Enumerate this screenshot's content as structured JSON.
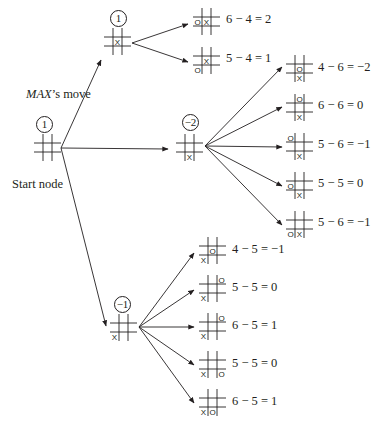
{
  "labels": {
    "max_move_italic": "MAX",
    "max_move_rest": "’s move",
    "start_node": "Start node"
  },
  "nodes": {
    "root": {
      "value": "1",
      "board": [
        "",
        "",
        "",
        "",
        "",
        "",
        "",
        "",
        ""
      ]
    },
    "top": {
      "value": "1",
      "board": [
        "",
        "",
        "",
        "",
        "X",
        "",
        "",
        "",
        ""
      ]
    },
    "middle": {
      "value": "−2",
      "board": [
        "",
        "",
        "",
        "",
        "",
        "",
        "",
        "X",
        ""
      ]
    },
    "bottom": {
      "value": "−1",
      "board": [
        "",
        "",
        "",
        "",
        "",
        "",
        "X",
        "",
        ""
      ]
    }
  },
  "leaves": {
    "top": [
      {
        "board": [
          "",
          "",
          "",
          "O",
          "X",
          "",
          "",
          "",
          ""
        ],
        "eval": "6 − 4 = 2"
      },
      {
        "board": [
          "",
          "",
          "",
          "",
          "X",
          "",
          "O",
          "",
          ""
        ],
        "eval": "5 − 4 = 1"
      }
    ],
    "middle": [
      {
        "board": [
          "",
          "",
          "",
          "",
          "O",
          "",
          "",
          "X",
          ""
        ],
        "eval": "4 − 6 = −2"
      },
      {
        "board": [
          "",
          "O",
          "",
          "",
          "",
          "",
          "",
          "X",
          ""
        ],
        "eval": "6 − 6 = 0"
      },
      {
        "board": [
          "O",
          "",
          "",
          "",
          "",
          "",
          "",
          "X",
          ""
        ],
        "eval": "5 − 6 = −1"
      },
      {
        "board": [
          "",
          "",
          "",
          "O",
          "",
          "",
          "",
          "X",
          ""
        ],
        "eval": "5 − 5 = 0"
      },
      {
        "board": [
          "",
          "",
          "",
          "",
          "",
          "",
          "O",
          "X",
          ""
        ],
        "eval": "5 − 6 = −1"
      }
    ],
    "bottom": [
      {
        "board": [
          "",
          "",
          "",
          "",
          "O",
          "",
          "X",
          "",
          ""
        ],
        "eval": "4 − 5 = −1"
      },
      {
        "board": [
          "",
          "",
          "O",
          "",
          "",
          "",
          "X",
          "",
          ""
        ],
        "eval": "5 − 5 = 0"
      },
      {
        "board": [
          "",
          "",
          "O",
          "",
          "",
          "",
          "X",
          "",
          ""
        ],
        "eval": "6 − 5 = 1"
      },
      {
        "board": [
          "",
          "",
          "",
          "",
          "",
          "",
          "X",
          "",
          "O"
        ],
        "eval": "5 − 5 = 0"
      },
      {
        "board": [
          "",
          "",
          "",
          "",
          "",
          "",
          "X",
          "O",
          ""
        ],
        "eval": "6 − 5 = 1"
      }
    ]
  },
  "colors": {
    "ink": "#231f20",
    "background": "#ffffff"
  }
}
